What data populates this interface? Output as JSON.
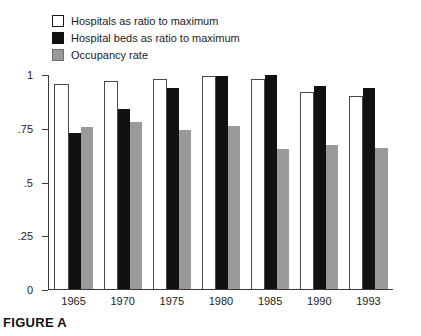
{
  "caption": "FIGURE A",
  "legend": {
    "items": [
      {
        "label": "Hospitals as ratio to maximum",
        "swatch": "white",
        "color": "#ffffff"
      },
      {
        "label": "Hospital beds as ratio to maximum",
        "swatch": "black",
        "color": "#111111"
      },
      {
        "label": "Occupancy rate",
        "swatch": "gray",
        "color": "#9a9a9a"
      }
    ]
  },
  "axis": {
    "y_ticks": [
      "0",
      ".25",
      ".5",
      ".75",
      "1"
    ],
    "y_values": [
      0,
      0.25,
      0.5,
      0.75,
      1
    ]
  },
  "chart_data": {
    "type": "bar",
    "title": "FIGURE A",
    "xlabel": "",
    "ylabel": "",
    "ylim": [
      0,
      1
    ],
    "grid": false,
    "legend_position": "top-left",
    "categories": [
      "1965",
      "1970",
      "1975",
      "1980",
      "1985",
      "1990",
      "1993"
    ],
    "series": [
      {
        "name": "Hospitals as ratio to maximum",
        "color": "#ffffff",
        "values": [
          0.96,
          0.97,
          0.98,
          0.995,
          0.98,
          0.92,
          0.9
        ]
      },
      {
        "name": "Hospital beds as ratio to maximum",
        "color": "#111111",
        "values": [
          0.73,
          0.84,
          0.94,
          0.995,
          1.0,
          0.95,
          0.94
        ]
      },
      {
        "name": "Occupancy rate",
        "color": "#9a9a9a",
        "values": [
          0.755,
          0.78,
          0.745,
          0.76,
          0.655,
          0.675,
          0.66
        ]
      }
    ]
  }
}
